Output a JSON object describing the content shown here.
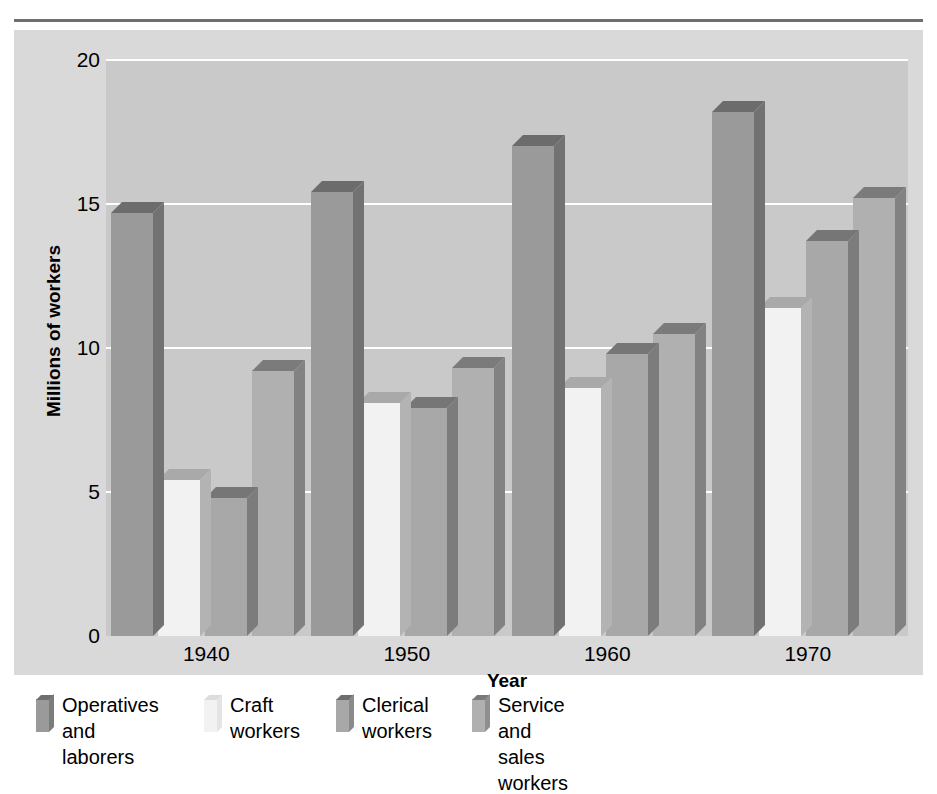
{
  "figure": {
    "clipped_caption_above": "",
    "y_axis_title": "Millions of workers",
    "x_axis_title": "Year"
  },
  "chart_data": {
    "type": "bar",
    "title": "",
    "subtitle": "",
    "xlabel": "Year",
    "ylabel": "Millions of workers",
    "categories": [
      "1940",
      "1950",
      "1960",
      "1970"
    ],
    "ylim": [
      0,
      20
    ],
    "yticks": [
      "0",
      "5",
      "10",
      "15",
      "20"
    ],
    "ytick_values": [
      0,
      5,
      10,
      15,
      20
    ],
    "grid": "horizontal white gridlines at 5, 10, 15, 20",
    "legend_position": "below plot, horizontal",
    "style": "3D grouped column chart, grayscale",
    "series": [
      {
        "name": "Operatives and laborers",
        "color": "#9a9a9a",
        "values": [
          14.7,
          15.4,
          17.0,
          18.2
        ]
      },
      {
        "name": "Craft workers",
        "color": "#f2f2f2",
        "values": [
          5.4,
          8.1,
          8.6,
          11.4
        ]
      },
      {
        "name": "Clerical workers",
        "color": "#a8a8a8",
        "values": [
          4.8,
          7.9,
          9.8,
          13.7
        ]
      },
      {
        "name": "Service and sales workers",
        "color": "#b0b0b0",
        "values": [
          9.2,
          9.3,
          10.5,
          15.2
        ]
      }
    ]
  },
  "legend": {
    "items": [
      {
        "label": "Operatives\nand laborers",
        "swatch_face": "#9a9a9a",
        "swatch_top": "#6e6e6e",
        "swatch_side": "#7c7c7c",
        "left": 22
      },
      {
        "label": "Craft\nworkers",
        "swatch_face": "#f2f2f2",
        "swatch_top": "#dcdcdc",
        "swatch_side": "#e4e4e4",
        "left": 190
      },
      {
        "label": "Clerical\nworkers",
        "swatch_face": "#a8a8a8",
        "swatch_top": "#6e6e6e",
        "swatch_side": "#8a8a8a",
        "left": 322
      },
      {
        "label": "Service and\nsales workers",
        "swatch_face": "#b0b0b0",
        "swatch_top": "#7a7a7a",
        "swatch_side": "#8f8f8f",
        "left": 458
      }
    ]
  },
  "colors": {
    "page_background": "#ffffff",
    "panel_background": "#d9d9d9",
    "plot_background": "#c9c9c9",
    "gridline": "#ffffff",
    "rule": "#6e6e6e",
    "text": "#000000",
    "bar_top_shade": "#6e6e6e",
    "bar_side_shade": "#7f7f7f"
  }
}
